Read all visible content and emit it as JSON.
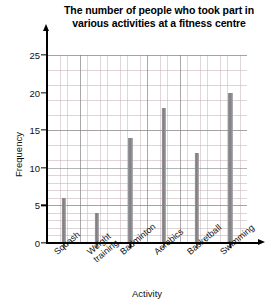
{
  "chart_data": {
    "type": "bar",
    "title": "The number of people who took part in various activities at a fitness centre",
    "title_line1": "The number of people who took part in",
    "title_line2": "various activities at a fitness centre",
    "xlabel": "Activity",
    "ylabel": "Frequency",
    "categories": [
      "Squash",
      "Weight training",
      "Badminton",
      "Aerobics",
      "Basketball",
      "Swimming"
    ],
    "values": [
      6,
      4,
      14,
      18,
      12,
      20
    ],
    "ylim": [
      0,
      25
    ],
    "ytick_labels": [
      "25",
      "20",
      "15",
      "10",
      "5",
      "0"
    ],
    "ytick_values": [
      25,
      20,
      15,
      10,
      5,
      0
    ],
    "ytick_step": 5,
    "minor_grid_step": 1,
    "grid": "major and minor",
    "legend": "none",
    "bar_color": "#85858a",
    "grid_major_color": "#787880",
    "grid_minor_color": "#c4b0b4",
    "axis_color": "#000000"
  }
}
